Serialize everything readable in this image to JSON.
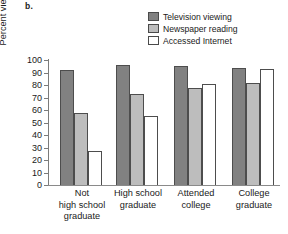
{
  "panel": {
    "label": "b."
  },
  "legend": {
    "position": "top-right",
    "items": [
      {
        "label": "Television viewing",
        "color": "#818181",
        "icon": "legend-swatch-icon"
      },
      {
        "label": "Newspaper reading",
        "color": "#bdbdbd",
        "icon": "legend-swatch-icon"
      },
      {
        "label": "Accessed Internet",
        "color": "#ffffff",
        "icon": "legend-swatch-icon"
      }
    ]
  },
  "axes": {
    "y_title": "Percent viewing or reading",
    "y_ticks": [
      "100",
      "90",
      "80",
      "70",
      "60",
      "50",
      "40",
      "30",
      "20",
      "10",
      "0"
    ],
    "x_title": ""
  },
  "chart_data": {
    "type": "bar",
    "title": "",
    "subtitle": "",
    "xlabel": "",
    "ylabel": "Percent viewing or reading",
    "ylim": [
      0,
      100
    ],
    "ytick_step": 10,
    "grid": false,
    "legend_position": "top-right",
    "categories": [
      "Not\nhigh school\ngraduate",
      "High school\ngraduate",
      "Attended\ncollege",
      "College\ngraduate"
    ],
    "series": [
      {
        "name": "Television viewing",
        "color": "#818181",
        "values": [
          92,
          96,
          95,
          94
        ]
      },
      {
        "name": "Newspaper reading",
        "color": "#bdbdbd",
        "values": [
          58,
          73,
          78,
          82
        ]
      },
      {
        "name": "Accessed Internet",
        "color": "#ffffff",
        "values": [
          27,
          55,
          81,
          93
        ]
      }
    ]
  }
}
